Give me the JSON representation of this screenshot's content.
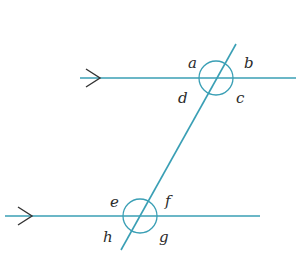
{
  "diagram": {
    "type": "parallel-lines-transversal",
    "colors": {
      "line": "#3a9fb5",
      "arrow": "#333333",
      "label": "#2b2b2b"
    },
    "upper_line": {
      "x1": 80,
      "y1": 78,
      "x2": 296,
      "y2": 78,
      "arrow_at": [
        100,
        78
      ]
    },
    "lower_line": {
      "x1": 5,
      "y1": 216,
      "x2": 260,
      "y2": 216,
      "arrow_at": [
        32,
        216
      ]
    },
    "transversal": {
      "x1": 236,
      "y1": 44,
      "x2": 121,
      "y2": 250
    },
    "upper_intersection": {
      "cx": 216,
      "cy": 78,
      "r": 17,
      "angles": [
        {
          "label": "a",
          "x": 188,
          "y": 68
        },
        {
          "label": "b",
          "x": 244,
          "y": 68
        },
        {
          "label": "c",
          "x": 236,
          "y": 103
        },
        {
          "label": "d",
          "x": 178,
          "y": 103
        }
      ]
    },
    "lower_intersection": {
      "cx": 140,
      "cy": 216,
      "r": 17,
      "angles": [
        {
          "label": "e",
          "x": 110,
          "y": 207
        },
        {
          "label": "f",
          "x": 165,
          "y": 206
        },
        {
          "label": "g",
          "x": 159,
          "y": 242
        },
        {
          "label": "h",
          "x": 103,
          "y": 242
        }
      ]
    }
  }
}
